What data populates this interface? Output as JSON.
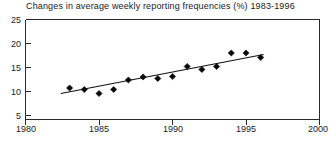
{
  "chart_data": {
    "type": "scatter",
    "title": "Changes in average weekly reporting frequencies (%) 1983-1996",
    "xlabel": "",
    "ylabel": "",
    "xlim": [
      1980,
      2000
    ],
    "ylim": [
      5,
      25
    ],
    "grid": false,
    "legend": null,
    "x_ticks": [
      1980,
      1985,
      1990,
      1995,
      2000
    ],
    "y_ticks": [
      5,
      10,
      15,
      20,
      25
    ],
    "x": [
      1983,
      1984,
      1985,
      1986,
      1987,
      1988,
      1989,
      1990,
      1991,
      1992,
      1993,
      1994,
      1995,
      1996
    ],
    "values": [
      11.3,
      11.0,
      10.2,
      11.0,
      12.9,
      13.5,
      13.2,
      13.6,
      15.6,
      15.0,
      15.6,
      18.3,
      18.3,
      17.4
    ],
    "series": [
      {
        "name": "Average weekly reporting frequency",
        "type": "scatter",
        "marker": "diamond",
        "values": [
          11.3,
          11.0,
          10.2,
          11.0,
          12.9,
          13.5,
          13.2,
          13.6,
          15.6,
          15.0,
          15.6,
          18.3,
          18.3,
          17.4
        ]
      },
      {
        "name": "Linear trend",
        "type": "line",
        "endpoints": [
          {
            "x": 1982.4,
            "y": 10.2
          },
          {
            "x": 1996.2,
            "y": 18.0
          }
        ]
      }
    ],
    "annotations": []
  },
  "axis": {
    "y_labels": [
      "25",
      "20",
      "15",
      "10",
      "5"
    ],
    "x_labels": [
      "1980",
      "1985",
      "1990",
      "1995",
      "2000"
    ]
  },
  "colors": {
    "marker": "#080808",
    "trend": "#111111",
    "axis": "#2b2b2b",
    "text": "#1a1a1a",
    "background": "#ffffff"
  }
}
